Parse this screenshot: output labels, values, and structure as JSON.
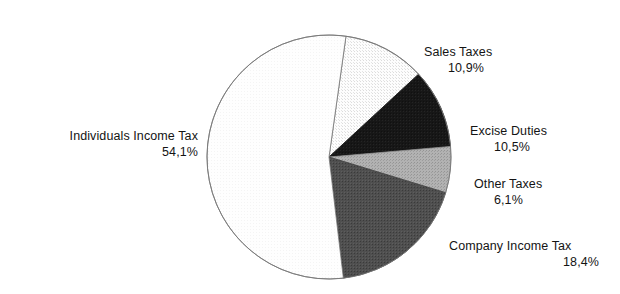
{
  "chart_data": {
    "type": "pie",
    "title": "",
    "subtitle": "",
    "xlabel": "",
    "ylabel": "",
    "legend_position": "none",
    "grid": false,
    "value_suffix": "%",
    "decimal_separator": ",",
    "start_angle_deg": 8,
    "direction": "clockwise",
    "categories": [
      "Sales Taxes",
      "Excise Duties",
      "Other Taxes",
      "Company Income Tax",
      "Individuals Income Tax"
    ],
    "values": [
      10.9,
      10.5,
      6.1,
      18.4,
      54.1
    ],
    "value_labels": [
      "10,9%",
      "10,5%",
      "6,1%",
      "18,4%",
      "54,1%"
    ],
    "colors": [
      "#e8e8e8",
      "#151515",
      "#a6a6a6",
      "#4a4a4a",
      "#fbfbfb"
    ],
    "slices": [
      {
        "name": "Sales Taxes",
        "value": 10.9,
        "value_label": "10,9%",
        "color": "#e8e8e8",
        "stroke": "#666666"
      },
      {
        "name": "Excise Duties",
        "value": 10.5,
        "value_label": "10,5%",
        "color": "#151515",
        "stroke": "#151515"
      },
      {
        "name": "Other Taxes",
        "value": 6.1,
        "value_label": "6,1%",
        "color": "#a6a6a6",
        "stroke": "#8f8f8f"
      },
      {
        "name": "Company Income Tax",
        "value": 18.4,
        "value_label": "18,4%",
        "color": "#4a4a4a",
        "stroke": "#3d3d3d"
      },
      {
        "name": "Individuals Income Tax",
        "value": 54.1,
        "value_label": "54,1%",
        "color": "#fcfcfc",
        "stroke": "#767676"
      }
    ]
  },
  "labels": {
    "individuals_income_tax": {
      "name": "Individuals Income Tax",
      "value": "54,1%"
    },
    "sales_taxes": {
      "name": "Sales Taxes",
      "value": "10,9%"
    },
    "excise_duties": {
      "name": "Excise Duties",
      "value": "10,5%"
    },
    "other_taxes": {
      "name": "Other Taxes",
      "value": "6,1%"
    },
    "company_income_tax": {
      "name": "Company Income Tax",
      "value": "18,4%"
    }
  },
  "colors": {
    "background": "#ffffff",
    "text": "#141414",
    "outline": "#767676"
  }
}
